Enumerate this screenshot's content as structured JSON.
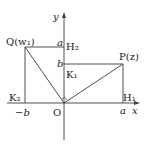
{
  "diagram": {
    "axes": {
      "x_label": "x",
      "y_label": "y",
      "origin_label": "O"
    },
    "points": {
      "Q": "Q(w₁)",
      "P": "P(z)",
      "H1": "H₁",
      "H2": "H₂",
      "K1": "K₁",
      "K2": "K₂"
    },
    "ticks": {
      "a_x": "a",
      "neg_b_x": "−b",
      "a_y": "a",
      "b_y": "b"
    },
    "colors": {
      "line": "#3a3a3a",
      "text": "#1a1a1a"
    }
  }
}
